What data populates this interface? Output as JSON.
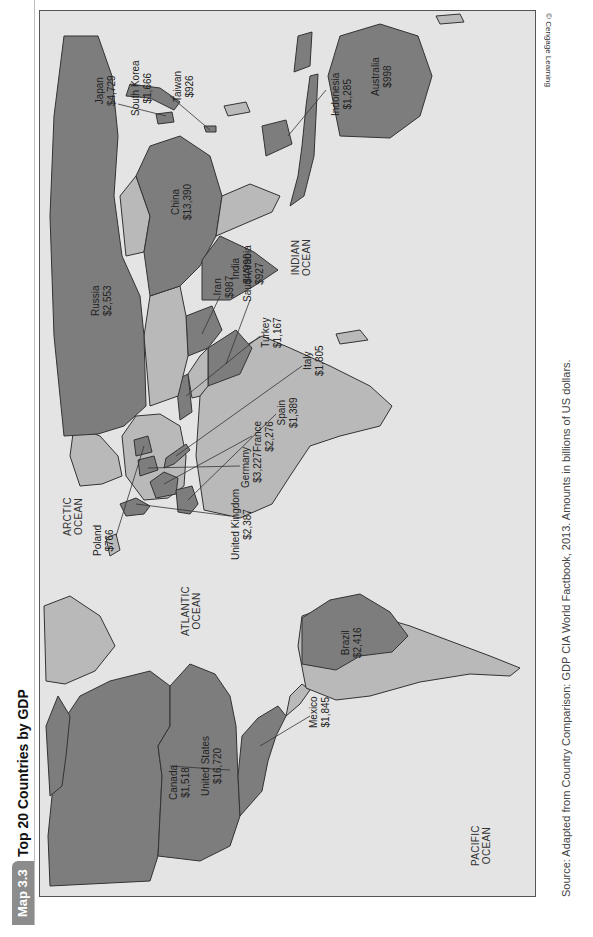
{
  "header": {
    "badge": "Map 3.3",
    "title": "Top 20 Countries by GDP"
  },
  "copyright": "© Cengage Learning",
  "source": "Source: Adapted from Country Comparison: GDP CIA World Factbook, 2013. Amounts in billions of US dollars.",
  "colors": {
    "top20_fill": "#7d7d7d",
    "other_land_fill": "#b9b9b9",
    "ocean_fill": "#e4e4e4",
    "border": "#333333",
    "badge_bg": "#8c8c8c"
  },
  "oceans": {
    "arctic": [
      "ARCTIC",
      "OCEAN"
    ],
    "atlantic": [
      "ATLANTIC",
      "OCEAN"
    ],
    "pacific": [
      "PACIFIC",
      "OCEAN"
    ],
    "indian": [
      "INDIAN",
      "OCEAN"
    ]
  },
  "countries": [
    {
      "name": "United States",
      "gdp": "$16,720"
    },
    {
      "name": "China",
      "gdp": "$13,390"
    },
    {
      "name": "India",
      "gdp": "$4,990"
    },
    {
      "name": "Japan",
      "gdp": "$4,729"
    },
    {
      "name": "Germany",
      "gdp": "$3,227"
    },
    {
      "name": "Russia",
      "gdp": "$2,553"
    },
    {
      "name": "Brazil",
      "gdp": "$2,416"
    },
    {
      "name": "United Kingdom",
      "gdp": "$2,387"
    },
    {
      "name": "France",
      "gdp": "$2,276"
    },
    {
      "name": "Mexico",
      "gdp": "$1,845"
    },
    {
      "name": "Italy",
      "gdp": "$1,805"
    },
    {
      "name": "South Korea",
      "gdp": "$1,666"
    },
    {
      "name": "Canada",
      "gdp": "$1,518"
    },
    {
      "name": "Spain",
      "gdp": "$1,389"
    },
    {
      "name": "Indonesia",
      "gdp": "$1,285"
    },
    {
      "name": "Turkey",
      "gdp": "$1,167"
    },
    {
      "name": "Australia",
      "gdp": "$998"
    },
    {
      "name": "Iran",
      "gdp": "$987"
    },
    {
      "name": "Saudi Arabia",
      "gdp": "$927"
    },
    {
      "name": "Taiwan",
      "gdp": "$926"
    },
    {
      "name": "Poland",
      "gdp": "$766"
    }
  ]
}
